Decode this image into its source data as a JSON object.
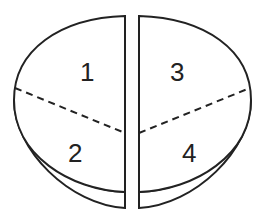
{
  "diagram": {
    "sections": [
      {
        "id": 1,
        "label": "1",
        "position": "upper-left"
      },
      {
        "id": 2,
        "label": "2",
        "position": "lower-left"
      },
      {
        "id": 3,
        "label": "3",
        "position": "upper-right"
      },
      {
        "id": 4,
        "label": "4",
        "position": "lower-right"
      }
    ],
    "colors": {
      "stroke": "#222222",
      "fill": "#ffffff"
    }
  }
}
